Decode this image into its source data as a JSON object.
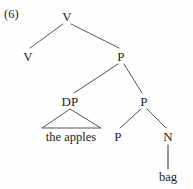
{
  "figure": {
    "example_number": "(6)",
    "type": "syntax-tree",
    "width": 193,
    "height": 189,
    "background_color": "#fefefe",
    "line_color": "#555555",
    "text_color": "#222222"
  },
  "tree": {
    "nodes": [
      {
        "id": "v-root",
        "label": "V",
        "x": 67,
        "y": 16
      },
      {
        "id": "v-left",
        "label": "V",
        "x": 28,
        "y": 56
      },
      {
        "id": "p-upper",
        "label": "P",
        "x": 121,
        "y": 56
      },
      {
        "id": "dp",
        "label": "DP",
        "x": 70,
        "y": 101
      },
      {
        "id": "p-mid",
        "label": "P",
        "x": 144,
        "y": 101
      },
      {
        "id": "p-lower",
        "label": "P",
        "x": 118,
        "y": 136
      },
      {
        "id": "n",
        "label": "N",
        "x": 168,
        "y": 136
      }
    ],
    "terminals": [
      {
        "id": "the-apples",
        "label": "the apples",
        "x": 71,
        "y": 137
      },
      {
        "id": "bag",
        "label": "bag",
        "x": 168,
        "y": 177
      }
    ],
    "branches": [
      {
        "from": "v-root",
        "to": "v-left",
        "x1": 63,
        "y1": 24,
        "x2": 30,
        "y2": 48
      },
      {
        "from": "v-root",
        "to": "p-upper",
        "x1": 71,
        "y1": 24,
        "x2": 119,
        "y2": 48
      },
      {
        "from": "p-upper",
        "to": "dp",
        "x1": 118,
        "y1": 64,
        "x2": 74,
        "y2": 93
      },
      {
        "from": "p-upper",
        "to": "p-mid",
        "x1": 124,
        "y1": 64,
        "x2": 142,
        "y2": 93
      },
      {
        "from": "p-mid",
        "to": "p-lower",
        "x1": 141,
        "y1": 109,
        "x2": 120,
        "y2": 128
      },
      {
        "from": "p-mid",
        "to": "n",
        "x1": 147,
        "y1": 109,
        "x2": 166,
        "y2": 128
      }
    ],
    "stems": [
      {
        "from": "n",
        "to": "bag",
        "x1": 168,
        "y1": 145,
        "x2": 168,
        "y2": 169
      }
    ],
    "triangles": [
      {
        "id": "dp-triangle",
        "parent": "dp",
        "covers": "the apples",
        "apex_x": 70,
        "apex_y": 109,
        "left_x": 42,
        "right_x": 101,
        "base_y": 128
      }
    ]
  }
}
